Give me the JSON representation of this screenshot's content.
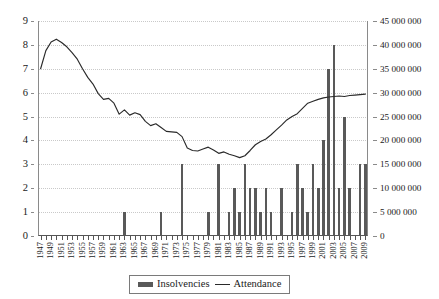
{
  "chart_data": {
    "type": "bar",
    "title": "",
    "subtitle": "",
    "xlabel": "",
    "ylabel": "",
    "ylabel_right": "",
    "grid": true,
    "legend_position": "bottom",
    "x": [
      1947,
      1948,
      1949,
      1950,
      1951,
      1952,
      1953,
      1954,
      1955,
      1956,
      1957,
      1958,
      1959,
      1960,
      1961,
      1962,
      1963,
      1964,
      1965,
      1966,
      1967,
      1968,
      1969,
      1970,
      1971,
      1972,
      1973,
      1974,
      1975,
      1976,
      1977,
      1978,
      1979,
      1980,
      1981,
      1982,
      1983,
      1984,
      1985,
      1986,
      1987,
      1988,
      1989,
      1990,
      1991,
      1992,
      1993,
      1994,
      1995,
      1996,
      1997,
      1998,
      1999,
      2000,
      2001,
      2002,
      2003,
      2004,
      2005,
      2006,
      2007,
      2008,
      2009
    ],
    "axis_left": {
      "min": 0,
      "max": 9,
      "step": 1,
      "ticks": [
        "0",
        "1",
        "2",
        "3",
        "4",
        "5",
        "6",
        "7",
        "8",
        "9"
      ]
    },
    "axis_right": {
      "min": 0,
      "max": 45000000,
      "step": 5000000,
      "ticks": [
        "0",
        "5 000 000",
        "10 000 000",
        "15 000 000",
        "20 000 000",
        "25 000 000",
        "30 000 000",
        "35 000 000",
        "40 000 000",
        "45 000 000"
      ]
    },
    "xticks": [
      "1947",
      "1948",
      "1949",
      "1950",
      "1951",
      "1952",
      "1953",
      "1954",
      "1955",
      "1956",
      "1957",
      "1958",
      "1959",
      "1960",
      "1961",
      "1962",
      "1963",
      "1964",
      "1965",
      "1966",
      "1967",
      "1968",
      "1969",
      "1970",
      "1971",
      "1972",
      "1973",
      "1974",
      "1975",
      "1976",
      "1977",
      "1978",
      "1979",
      "1980",
      "1981",
      "1982",
      "1983",
      "1984",
      "1985",
      "1986",
      "1987",
      "1988",
      "1989",
      "1990",
      "1991",
      "1992",
      "1993",
      "1994",
      "1995",
      "1996",
      "1997",
      "1998",
      "1999",
      "2000",
      "2001",
      "2002",
      "2003",
      "2004",
      "2005",
      "2006",
      "2007",
      "2008",
      "2009"
    ],
    "xtick_labels_shown": [
      "1947",
      "1949",
      "1951",
      "1953",
      "1955",
      "1957",
      "1959",
      "1961",
      "1963",
      "1965",
      "1967",
      "1969",
      "1971",
      "1973",
      "1975",
      "1977",
      "1979",
      "1981",
      "1983",
      "1985",
      "1987",
      "1989",
      "1991",
      "1993",
      "1995",
      "1997",
      "1999",
      "2001",
      "2003",
      "2005",
      "2007",
      "2009"
    ],
    "series": [
      {
        "name": "Insolvencies",
        "type": "bar",
        "axis": "left",
        "color": "#595959",
        "values": [
          0,
          0,
          0,
          0,
          0,
          0,
          0,
          0,
          0,
          0,
          0,
          0,
          0,
          0,
          0,
          0,
          1,
          0,
          0,
          0,
          0,
          0,
          0,
          1,
          0,
          0,
          0,
          3,
          0,
          0,
          0,
          0,
          1,
          0,
          3,
          0,
          1,
          2,
          1,
          3,
          2,
          2,
          1,
          2,
          1,
          0,
          2,
          0,
          1,
          3,
          2,
          1,
          3,
          2,
          4,
          7,
          8,
          2,
          5,
          2,
          0,
          3,
          3
        ]
      },
      {
        "name": "Attendance",
        "type": "line",
        "axis": "right",
        "color": "#2a2a2a",
        "values": [
          35000000,
          38800000,
          40600000,
          41200000,
          40500000,
          39600000,
          38400000,
          37000000,
          35000000,
          33200000,
          31800000,
          29800000,
          28600000,
          28800000,
          27800000,
          25500000,
          26400000,
          25300000,
          25800000,
          25400000,
          24000000,
          23100000,
          23500000,
          22700000,
          21900000,
          21800000,
          21700000,
          20800000,
          18400000,
          17900000,
          17800000,
          18200000,
          18600000,
          18000000,
          17300000,
          17600000,
          17100000,
          16800000,
          16400000,
          16800000,
          17900000,
          19100000,
          19800000,
          20300000,
          21200000,
          22200000,
          23200000,
          24300000,
          25000000,
          25600000,
          26700000,
          27800000,
          28200000,
          28600000,
          28900000,
          29100000,
          29200000,
          29300000,
          29200000,
          29400000,
          29500000,
          29600000,
          29700000
        ]
      }
    ]
  },
  "legend": {
    "items": [
      {
        "label": "Insolvencies",
        "marker": "bar-swatch"
      },
      {
        "label": "Attendance",
        "marker": "line-swatch"
      }
    ]
  }
}
